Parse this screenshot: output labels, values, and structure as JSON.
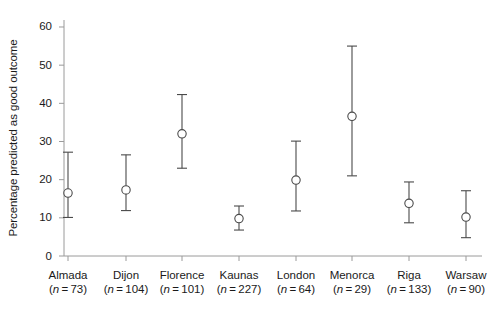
{
  "figure": {
    "background": "#ffffff",
    "ink": "#4a4a4a",
    "text_color": "#1a1a1a"
  },
  "axes": {
    "ylabel": "Percentage predicted as good outcome",
    "xlabel": "",
    "yticks": [
      0,
      10,
      20,
      30,
      40,
      50,
      60
    ],
    "ytick_labels": [
      "0",
      "10",
      "20",
      "30",
      "40",
      "50",
      "60"
    ],
    "ylim": [
      0,
      62
    ],
    "grid": false
  },
  "categories": [
    {
      "name": "Almada",
      "n_prefix": "(n",
      "n_eq": "=",
      "n_value": "73)",
      "n_label": "(n=73)"
    },
    {
      "name": "Dijon",
      "n_prefix": "(n",
      "n_eq": "=",
      "n_value": "104)",
      "n_label": "(n=104)"
    },
    {
      "name": "Florence",
      "n_prefix": "(n",
      "n_eq": "=",
      "n_value": "101)",
      "n_label": "(n=101)"
    },
    {
      "name": "Kaunas",
      "n_prefix": "(n",
      "n_eq": "=",
      "n_value": "227)",
      "n_label": "(n=227)"
    },
    {
      "name": "London",
      "n_prefix": "(n",
      "n_eq": "=",
      "n_value": "64)",
      "n_label": "(n=64)"
    },
    {
      "name": "Menorca",
      "n_prefix": "(n",
      "n_eq": "=",
      "n_value": "29)",
      "n_label": "(n=29)"
    },
    {
      "name": "Riga",
      "n_prefix": "(n",
      "n_eq": "=",
      "n_value": "133)",
      "n_label": "(n=133)"
    },
    {
      "name": "Warsaw",
      "n_prefix": "(n",
      "n_eq": "=",
      "n_value": "90)",
      "n_label": "(n=90)"
    }
  ],
  "chart_data": {
    "type": "scatter",
    "title": "",
    "subtitle": "",
    "xlabel": "",
    "ylabel": "Percentage predicted as good outcome",
    "ylim": [
      0,
      62
    ],
    "yticks": [
      0,
      10,
      20,
      30,
      40,
      50,
      60
    ],
    "grid": false,
    "legend": null,
    "marker": "open-circle",
    "errorbar_style": "capped-vertical",
    "categories": [
      "Almada",
      "Dijon",
      "Florence",
      "Kaunas",
      "London",
      "Menorca",
      "Riga",
      "Warsaw"
    ],
    "sample_sizes": [
      73,
      104,
      101,
      227,
      64,
      29,
      133,
      90
    ],
    "values": [
      16.5,
      17.3,
      32.0,
      9.8,
      19.9,
      36.6,
      13.8,
      10.2
    ],
    "ci_lower": [
      10.1,
      11.9,
      23.0,
      6.8,
      11.8,
      21.0,
      8.7,
      4.8
    ],
    "ci_upper": [
      27.2,
      26.5,
      42.3,
      13.1,
      30.1,
      55.0,
      19.4,
      17.1
    ],
    "series": [
      {
        "name": "Percentage predicted as good outcome",
        "points": [
          {
            "category": "Almada",
            "x": 1,
            "value": 16.5,
            "low": 10.1,
            "high": 27.2,
            "n": 73
          },
          {
            "category": "Dijon",
            "x": 2,
            "value": 17.3,
            "low": 11.9,
            "high": 26.5,
            "n": 104
          },
          {
            "category": "Florence",
            "x": 3,
            "value": 32.0,
            "low": 23.0,
            "high": 42.3,
            "n": 101
          },
          {
            "category": "Kaunas",
            "x": 4,
            "value": 9.8,
            "low": 6.8,
            "high": 13.1,
            "n": 227
          },
          {
            "category": "London",
            "x": 5,
            "value": 19.9,
            "low": 11.8,
            "high": 30.1,
            "n": 64
          },
          {
            "category": "Menorca",
            "x": 6,
            "value": 36.6,
            "low": 21.0,
            "high": 55.0,
            "n": 29
          },
          {
            "category": "Riga",
            "x": 7,
            "value": 13.8,
            "low": 8.7,
            "high": 19.4,
            "n": 133
          },
          {
            "category": "Warsaw",
            "x": 8,
            "value": 10.2,
            "low": 4.8,
            "high": 17.1,
            "n": 90
          }
        ]
      }
    ]
  },
  "geometry": {
    "plot_left": 64,
    "plot_right": 482,
    "plot_bottom": 256,
    "plot_top": 20,
    "y_zero_px": 256,
    "px_per_unit": 3.8167,
    "category_x": [
      68,
      126,
      182,
      239,
      296,
      352,
      409,
      466
    ]
  }
}
